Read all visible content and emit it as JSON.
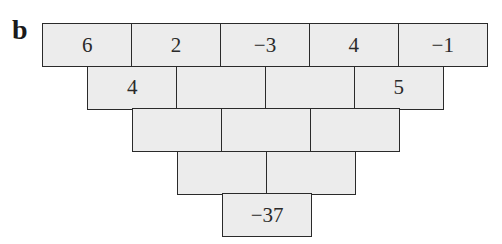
{
  "label": "b",
  "pyramid": {
    "rows": [
      [
        "6",
        "2",
        "−3",
        "4",
        "−1"
      ],
      [
        "4",
        "",
        "",
        "5"
      ],
      [
        "",
        "",
        ""
      ],
      [
        "",
        ""
      ],
      [
        "−37"
      ]
    ]
  },
  "colors": {
    "cell_fill": "#ececec",
    "border": "#2a2a2a",
    "text": "#2a2a2a"
  }
}
